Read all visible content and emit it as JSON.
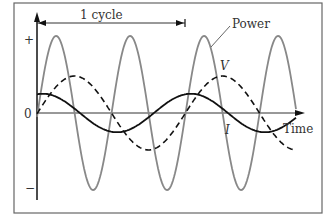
{
  "chart_data": {
    "type": "line",
    "title": "",
    "xlabel": "Time",
    "ylabel": "",
    "y_tick_labels": [
      "+",
      "0",
      "−"
    ],
    "annotations": [
      {
        "text": "1 cycle",
        "type": "span-arrow",
        "from_x": 0,
        "to_x": 1
      },
      {
        "text": "Power",
        "type": "leader-label"
      },
      {
        "text": "V",
        "type": "curve-label"
      },
      {
        "text": "I",
        "type": "curve-label"
      }
    ],
    "series": [
      {
        "name": "Power",
        "style": "solid gray",
        "description": "oscillates at twice the frequency of V and I, amplitude ~1.0",
        "amplitude": 1.0,
        "frequency_relative": 2
      },
      {
        "name": "V",
        "style": "dashed black",
        "description": "sinusoid starting at 0 rising, amplitude ~0.48",
        "amplitude": 0.48,
        "frequency_relative": 1,
        "phase": "starts at zero"
      },
      {
        "name": "I",
        "style": "solid black",
        "description": "sinusoid leading V by ~90°, amplitude ~0.25",
        "amplitude": 0.25,
        "frequency_relative": 1,
        "phase": "starts at maximum"
      }
    ],
    "x_range_cycles": [
      0,
      1.8
    ],
    "grid": false,
    "legend": "none (inline labels)"
  },
  "labels": {
    "cycle": "1 cycle",
    "power": "Power",
    "v": "V",
    "i": "I",
    "time": "Time",
    "plus": "+",
    "zero": "0",
    "minus": "−"
  }
}
